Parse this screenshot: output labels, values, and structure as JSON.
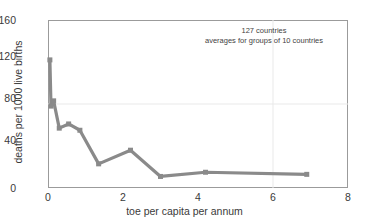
{
  "chart_data": {
    "type": "line",
    "title": "",
    "xlabel": "toe per capita per annum",
    "ylabel": "deaths per 1000 live births",
    "xlim": [
      0,
      8
    ],
    "ylim": [
      0,
      160
    ],
    "xticks": [
      0,
      2,
      4,
      6,
      8
    ],
    "yticks": [
      0,
      40,
      80,
      120,
      160
    ],
    "xtick_labels": [
      "0",
      "2",
      "4",
      "6",
      "8"
    ],
    "ytick_labels": [
      "0",
      "40",
      "80",
      "120",
      "160"
    ],
    "grid": "faint gridlines at y=80 and x=6",
    "legend": "none",
    "marker": "square",
    "line_color": "#8a8a8a",
    "series": [
      {
        "name": "averages for groups of 10 countries",
        "x": [
          0.05,
          0.08,
          0.15,
          0.3,
          0.55,
          0.85,
          1.35,
          2.2,
          3.0,
          4.2,
          6.9
        ],
        "y": [
          122,
          78,
          83,
          57,
          61,
          55,
          23,
          36,
          11,
          15,
          13
        ]
      }
    ],
    "annotations": [
      "127 countries",
      "averages for groups of 10 countries"
    ]
  },
  "axes": {
    "x_title": "toe per capita per annum",
    "y_title": "deaths per 1000 live births",
    "x_ticks": [
      {
        "label": "0",
        "value": 0
      },
      {
        "label": "2",
        "value": 2
      },
      {
        "label": "4",
        "value": 4
      },
      {
        "label": "6",
        "value": 6
      },
      {
        "label": "8",
        "value": 8
      }
    ],
    "y_ticks": [
      {
        "label": "0",
        "value": 0
      },
      {
        "label": "40",
        "value": 40
      },
      {
        "label": "80",
        "value": 80
      },
      {
        "label": "120",
        "value": 120
      },
      {
        "label": "160",
        "value": 160
      }
    ]
  },
  "note": {
    "line1": "127 countries",
    "line2": "averages for groups of 10 countries"
  },
  "colors": {
    "series": "#8a8a8a",
    "frame": "#9b9b9b",
    "grid": "#e8e8e8",
    "text": "#3a3a3a"
  }
}
